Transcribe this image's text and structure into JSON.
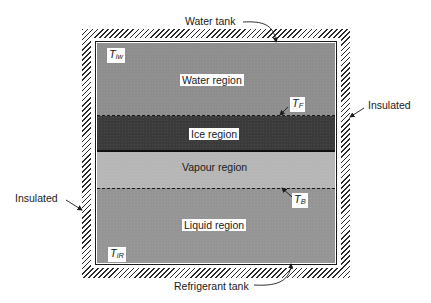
{
  "figure": {
    "external_labels": {
      "water_tank": "Water tank",
      "refrigerant_tank": "Refrigerant tank",
      "insulated_right": "Insulated",
      "insulated_left": "Insulated"
    },
    "regions": {
      "water": "Water region",
      "ice": "Ice region",
      "vapour": "Vapour region",
      "liquid": "Liquid region"
    },
    "symbols": {
      "t_iw": {
        "main": "T",
        "sub": "iw"
      },
      "t_f": {
        "main": "T",
        "sub": "F"
      },
      "t_b": {
        "main": "T",
        "sub": "B"
      },
      "t_ir": {
        "main": "T",
        "sub": "iR"
      }
    },
    "colors": {
      "water": "#8e8e8e",
      "ice": "#3b3b3b",
      "vapour": "#b6b6b6",
      "liquid": "#959595",
      "line": "#1a1a1a"
    }
  }
}
